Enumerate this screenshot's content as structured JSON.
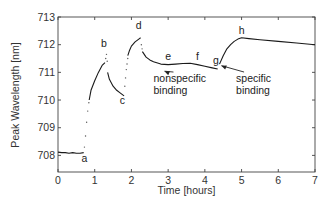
{
  "chart_data": {
    "type": "line",
    "title": "",
    "xlabel": "Time [hours]",
    "ylabel": "Peak Wavelength [nm]",
    "xlim": [
      0,
      7
    ],
    "ylim": [
      707.4,
      713
    ],
    "xticks": [
      0,
      1,
      2,
      3,
      4,
      5,
      6,
      7
    ],
    "yticks": [
      708,
      709,
      710,
      711,
      712,
      713
    ],
    "grid": false,
    "legend": null,
    "series": [
      {
        "name": "segment-a",
        "style": "solid",
        "x": [
          0.0,
          0.1,
          0.2,
          0.3,
          0.4,
          0.5,
          0.6,
          0.7
        ],
        "y": [
          708.12,
          708.1,
          708.1,
          708.08,
          708.1,
          708.08,
          708.08,
          708.1
        ]
      },
      {
        "name": "transition-a-b",
        "style": "dotted",
        "x": [
          0.72,
          0.75,
          0.78,
          0.81,
          0.84
        ],
        "y": [
          708.3,
          708.7,
          709.2,
          709.6,
          709.9
        ]
      },
      {
        "name": "segment-rise-to-b",
        "style": "solid",
        "x": [
          0.85,
          0.9,
          1.0,
          1.1,
          1.2,
          1.28
        ],
        "y": [
          710.0,
          710.35,
          710.7,
          711.0,
          711.25,
          711.35
        ]
      },
      {
        "name": "peak-b-dots",
        "style": "dotted",
        "x": [
          1.3,
          1.32,
          1.34
        ],
        "y": [
          711.5,
          711.65,
          711.4
        ]
      },
      {
        "name": "segment-b-c",
        "style": "solid",
        "x": [
          1.35,
          1.4,
          1.5,
          1.6,
          1.7,
          1.8
        ],
        "y": [
          711.0,
          710.75,
          710.5,
          710.35,
          710.25,
          710.15
        ]
      },
      {
        "name": "transition-c-d",
        "style": "dotted",
        "x": [
          1.82,
          1.84,
          1.86,
          1.88,
          1.9
        ],
        "y": [
          710.5,
          710.8,
          711.1,
          711.3,
          711.5
        ]
      },
      {
        "name": "segment-rise-to-d",
        "style": "solid",
        "x": [
          1.9,
          1.95,
          2.0,
          2.1,
          2.2,
          2.25
        ],
        "y": [
          711.6,
          711.8,
          711.95,
          712.1,
          712.2,
          712.25
        ]
      },
      {
        "name": "transition-d-e",
        "style": "dotted",
        "x": [
          2.27,
          2.29
        ],
        "y": [
          712.0,
          711.85
        ]
      },
      {
        "name": "segment-d-h",
        "style": "solid",
        "x": [
          2.3,
          2.4,
          2.5,
          2.6,
          2.8,
          3.0,
          3.2,
          3.4,
          3.6,
          3.8,
          4.0,
          4.2,
          4.35
        ],
        "y": [
          711.75,
          711.55,
          711.45,
          711.38,
          711.3,
          711.28,
          711.3,
          711.32,
          711.33,
          711.28,
          711.22,
          711.16,
          711.12
        ]
      },
      {
        "name": "segment-g-h",
        "style": "solid",
        "x": [
          4.4,
          4.5,
          4.6,
          4.7,
          4.8,
          4.9,
          5.0,
          5.2,
          5.5,
          6.0,
          6.5,
          7.0
        ],
        "y": [
          711.3,
          711.6,
          711.85,
          712.0,
          712.12,
          712.2,
          712.25,
          712.22,
          712.18,
          712.12,
          712.06,
          712.0
        ]
      }
    ],
    "annotations": [
      {
        "text": "a",
        "x": 0.72,
        "y": 707.75
      },
      {
        "text": "b",
        "x": 1.25,
        "y": 711.9
      },
      {
        "text": "c",
        "x": 1.75,
        "y": 709.85
      },
      {
        "text": "d",
        "x": 2.2,
        "y": 712.55
      },
      {
        "text": "e",
        "x": 3.0,
        "y": 711.45
      },
      {
        "text": "f",
        "x": 3.8,
        "y": 711.45
      },
      {
        "text": "g",
        "x": 4.3,
        "y": 711.3
      },
      {
        "text": "h",
        "x": 5.0,
        "y": 712.4
      },
      {
        "text": "nonspecific",
        "x": 2.6,
        "y": 710.65,
        "lines": [
          "nonspecific",
          "binding"
        ],
        "arrow_to": [
          2.9,
          711.15
        ]
      },
      {
        "text": "specific",
        "x": 4.85,
        "y": 710.65,
        "lines": [
          "specific",
          "binding"
        ],
        "arrow_to": [
          4.45,
          711.35
        ]
      }
    ]
  }
}
